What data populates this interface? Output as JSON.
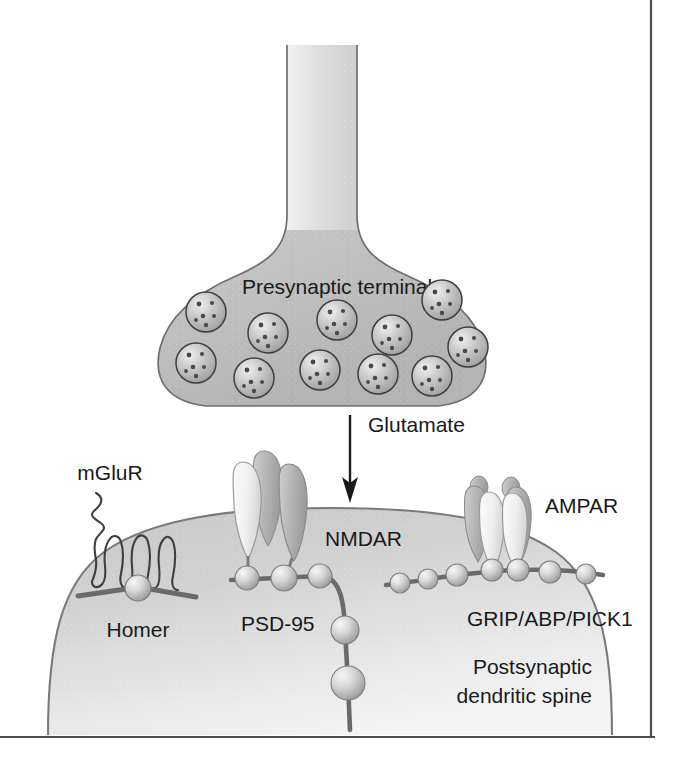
{
  "figure": {
    "frame": {
      "border_color": "#4d4d4d",
      "background": "#ffffff"
    },
    "labels": {
      "presynaptic_terminal": "Presynaptic terminal",
      "glutamate": "Glutamate",
      "mglur": "mGluR",
      "homer": "Homer",
      "nmdar": "NMDAR",
      "psd95": "PSD-95",
      "ampar": "AMPAR",
      "grip_abp_pick1": "GRIP/ABP/PICK1",
      "postsynaptic_line1": "Postsynaptic",
      "postsynaptic_line2": "dendritic spine"
    },
    "colors": {
      "cell_fill_light": "#e4e4e4",
      "cell_fill_mid": "#c2c2c2",
      "cell_fill_dark": "#a8a8a8",
      "outline": "#666666",
      "text": "#191919",
      "receptor_light": "#f2f2f2",
      "receptor_dark": "#a9a9a9",
      "bead_light": "#e8e8e8",
      "bead_dark": "#9a9a9a",
      "arrow": "#1a1a1a"
    },
    "counts": {
      "vesicles": 11,
      "nmdar_subunits": 3,
      "ampar_subunits": 4,
      "psd95_horizontal_beads": 3,
      "psd95_vertical_beads": 2,
      "grip_beads": 7,
      "mglur_transmembrane_loops": 7
    },
    "vesicles": [
      {
        "cx": 206,
        "cy": 312,
        "r": 20
      },
      {
        "cx": 268,
        "cy": 333,
        "r": 20
      },
      {
        "cx": 337,
        "cy": 320,
        "r": 20
      },
      {
        "cx": 392,
        "cy": 335,
        "r": 20
      },
      {
        "cx": 442,
        "cy": 300,
        "r": 20
      },
      {
        "cx": 468,
        "cy": 347,
        "r": 20
      },
      {
        "cx": 196,
        "cy": 363,
        "r": 20
      },
      {
        "cx": 254,
        "cy": 378,
        "r": 20
      },
      {
        "cx": 320,
        "cy": 370,
        "r": 20
      },
      {
        "cx": 378,
        "cy": 374,
        "r": 20
      },
      {
        "cx": 432,
        "cy": 376,
        "r": 20
      }
    ],
    "psd95_chain": {
      "horizontal": [
        {
          "cx": 247,
          "cy": 578,
          "r": 12
        },
        {
          "cx": 284,
          "cy": 578,
          "r": 13
        },
        {
          "cx": 320,
          "cy": 576,
          "r": 12
        }
      ],
      "vertical": [
        {
          "cx": 345,
          "cy": 630,
          "r": 14
        },
        {
          "cx": 348,
          "cy": 683,
          "r": 17
        }
      ]
    },
    "grip_chain": [
      {
        "cx": 400,
        "cy": 583,
        "r": 10
      },
      {
        "cx": 428,
        "cy": 579,
        "r": 10
      },
      {
        "cx": 457,
        "cy": 575,
        "r": 11
      },
      {
        "cx": 492,
        "cy": 570,
        "r": 11
      },
      {
        "cx": 518,
        "cy": 570,
        "r": 11
      },
      {
        "cx": 550,
        "cy": 572,
        "r": 11
      },
      {
        "cx": 586,
        "cy": 574,
        "r": 10
      }
    ],
    "homer": {
      "cx": 138,
      "cy": 588,
      "r": 13
    },
    "arrow": {
      "x": 350,
      "y_start": 415,
      "y_end": 500
    }
  }
}
